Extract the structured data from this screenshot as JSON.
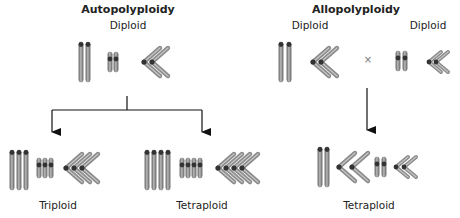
{
  "panels": {
    "auto": {
      "title": "Autopolyploidy",
      "parent_label": "Diploid",
      "children": [
        {
          "label": "Triploid",
          "copies": 3
        },
        {
          "label": "Tetraploid",
          "copies": 4
        }
      ]
    },
    "allo": {
      "title": "Allopolyploidy",
      "parent_a_label": "Diploid",
      "parent_b_label": "Diploid",
      "cross_symbol": "×",
      "child_label": "Tetraploid"
    }
  },
  "colors": {
    "chromosome_fill": "#9a9a9a",
    "chromosome_edge": "#5a5a5a",
    "centromere": "#333333",
    "arrow": "#111111",
    "text": "#222222"
  }
}
